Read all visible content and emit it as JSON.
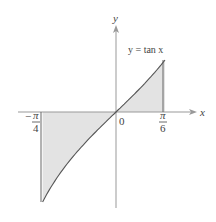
{
  "chart_data": {
    "type": "area",
    "title": "",
    "function_label": "y = tan x",
    "xlabel": "x",
    "ylabel": "y",
    "origin_label": "0",
    "x_ticks": [
      {
        "value": -0.7854,
        "sign": "−",
        "numerator": "π",
        "denominator": "4"
      },
      {
        "value": 0.5236,
        "sign": "",
        "numerator": "π",
        "denominator": "6"
      }
    ],
    "shaded_region": {
      "x_from": -0.7854,
      "x_to": 0.5236,
      "between": [
        "y = tan x",
        "y = 0"
      ]
    },
    "curve_points": [
      {
        "x": -0.7854,
        "y": -1.0
      },
      {
        "x": -0.6,
        "y": -0.684
      },
      {
        "x": -0.4,
        "y": -0.423
      },
      {
        "x": -0.2,
        "y": -0.203
      },
      {
        "x": 0.0,
        "y": 0.0
      },
      {
        "x": 0.2,
        "y": 0.203
      },
      {
        "x": 0.4,
        "y": 0.423
      },
      {
        "x": 0.5236,
        "y": 0.577
      }
    ],
    "grid": false,
    "colors": {
      "fill": "#e3e3e3",
      "curve": "#555555",
      "axis": "#888888"
    }
  }
}
